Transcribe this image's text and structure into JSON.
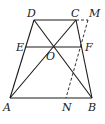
{
  "diagram": {
    "points": {
      "A": {
        "label": "A",
        "x": 10,
        "y": 98,
        "lx": 3,
        "ly": 111
      },
      "B": {
        "label": "B",
        "x": 92,
        "y": 98,
        "lx": 88,
        "ly": 111
      },
      "C": {
        "label": "C",
        "x": 76,
        "y": 20,
        "lx": 71,
        "ly": 17
      },
      "D": {
        "label": "D",
        "x": 34,
        "y": 20,
        "lx": 27,
        "ly": 17
      },
      "E": {
        "label": "E",
        "x": 26,
        "y": 47,
        "lx": 16,
        "ly": 51
      },
      "F": {
        "label": "F",
        "x": 82,
        "y": 47,
        "lx": 85,
        "ly": 51
      },
      "O": {
        "label": "O",
        "x": 52,
        "y": 47,
        "lx": 46,
        "ly": 60
      },
      "M": {
        "label": "M",
        "x": 88,
        "y": 20,
        "lx": 89,
        "ly": 17
      },
      "N": {
        "label": "N",
        "x": 66,
        "y": 98,
        "lx": 62,
        "ly": 111
      }
    },
    "segments": [
      {
        "from": "A",
        "to": "B",
        "style": "solid"
      },
      {
        "from": "B",
        "to": "C",
        "style": "solid"
      },
      {
        "from": "C",
        "to": "D",
        "style": "solid"
      },
      {
        "from": "D",
        "to": "A",
        "style": "solid"
      },
      {
        "from": "A",
        "to": "C",
        "style": "solid"
      },
      {
        "from": "B",
        "to": "D",
        "style": "solid"
      },
      {
        "from": "E",
        "to": "F",
        "style": "solid"
      },
      {
        "from": "C",
        "to": "M",
        "style": "dashed"
      },
      {
        "from": "M",
        "to": "N",
        "style": "dashed"
      }
    ],
    "line_color": "#1a1a1a"
  }
}
